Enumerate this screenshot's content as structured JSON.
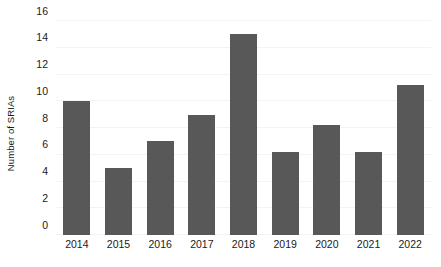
{
  "chart_data": {
    "type": "bar",
    "title": "",
    "xlabel": "",
    "ylabel": "Number of SRIAs",
    "categories": [
      "2014",
      "2015",
      "2016",
      "2017",
      "2018",
      "2019",
      "2020",
      "2021",
      "2022"
    ],
    "values": [
      10,
      5,
      7,
      9,
      15,
      6.2,
      8.2,
      6.2,
      11.2
    ],
    "ylim": [
      0,
      16
    ],
    "y_ticks": [
      0,
      2,
      4,
      6,
      8,
      10,
      12,
      14,
      16
    ],
    "y_tick_labels": [
      "0",
      "2",
      "4",
      "6",
      "8",
      "10",
      "12",
      "14",
      "16"
    ],
    "grid": true,
    "legend": null,
    "bar_color": "#585858",
    "grid_color": "#f3f3f3",
    "background_color": "#ffffff"
  }
}
